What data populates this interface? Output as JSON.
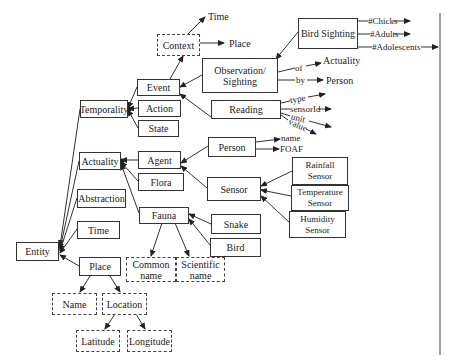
{
  "diagram": {
    "type": "ontology-hierarchy",
    "nodes": {
      "entity": "Entity",
      "temporality": "Temporality",
      "actuality": "Actuality",
      "abstraction": "Abstraction",
      "time": "Time",
      "place": "Place",
      "event": "Event",
      "action": "Action",
      "state": "State",
      "context": "Context",
      "observation": "Observation/ Sighting",
      "reading": "Reading",
      "bird_sighting": "Bird Sighting",
      "agent": "Agent",
      "flora": "Flora",
      "fauna": "Fauna",
      "person": "Person",
      "sensor": "Sensor",
      "rainfall_sensor": "Rainfall Sensor",
      "temperature_sensor": "Temperature Sensor",
      "humidity_sensor": "Humidity Sensor",
      "snake": "Snake",
      "bird": "Bird",
      "common_name": "Common name",
      "scientific_name": "Scientific name",
      "name": "Name",
      "location": "Location",
      "latitude": "Latitude",
      "longitude": "Longitude"
    },
    "labels": {
      "context_time": "Time",
      "context_place": "Place",
      "chicks": "#Chicks",
      "adults": "#Adults",
      "adolescents": "#Adolescents",
      "of": "of",
      "by": "by",
      "of_target": "Actuality",
      "by_target": "Person",
      "type": "type",
      "sensor_id": "sensorId",
      "unit": "unit",
      "value": "value",
      "person_name": "name",
      "foaf": "FOAF"
    },
    "colors": {
      "line": "#333333",
      "background": "#ffffff"
    }
  }
}
